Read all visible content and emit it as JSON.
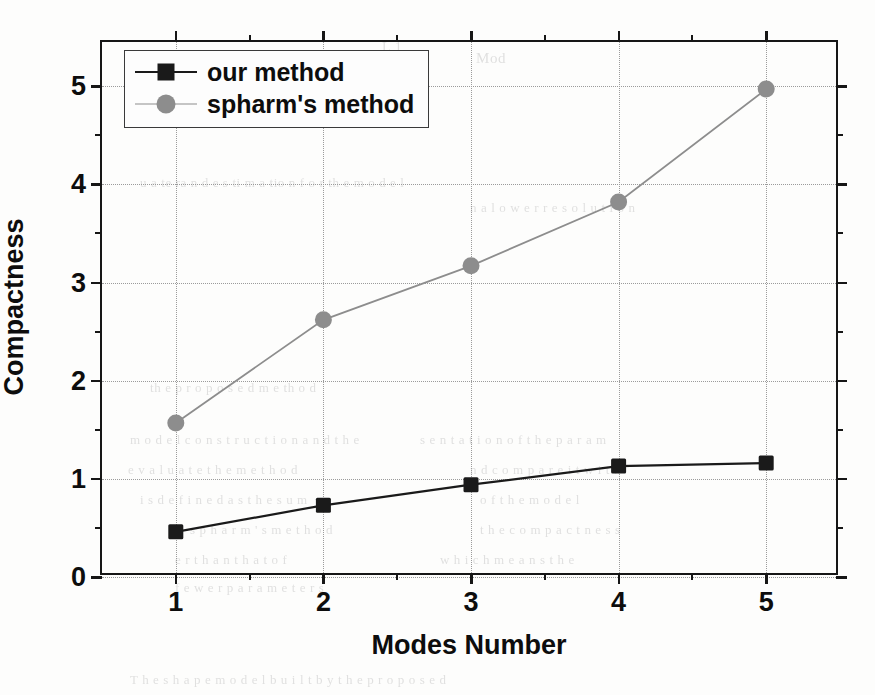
{
  "figure": {
    "background_note": "scanned page",
    "frame_color": "#161616"
  },
  "chart_data": {
    "type": "line",
    "title": "",
    "subtitle": "",
    "xlabel": "Modes Number",
    "ylabel": "Compactness",
    "x": [
      1,
      2,
      3,
      4,
      5
    ],
    "xtick_labels": [
      "1",
      "2",
      "3",
      "4",
      "5"
    ],
    "ytick_labels": [
      "0",
      "1",
      "2",
      "3",
      "4",
      "5"
    ],
    "xlim": [
      0.5,
      5.5
    ],
    "ylim": [
      0,
      5.45
    ],
    "grid": true,
    "grid_style": "dotted",
    "minor_ticks": true,
    "legend_position": "top-left",
    "series": [
      {
        "name": "our method",
        "values": [
          0.46,
          0.73,
          0.94,
          1.13,
          1.16
        ],
        "color": "#1a1a1a",
        "marker": "square",
        "marker_size": 15,
        "line_width": 2.2
      },
      {
        "name": "spharm's method",
        "values": [
          1.57,
          2.62,
          3.17,
          3.82,
          4.97
        ],
        "color": "#8d8d8d",
        "marker": "circle",
        "marker_size": 17,
        "line_width": 1.8
      }
    ]
  },
  "legend": {
    "items": [
      {
        "label": "our method",
        "color": "#1a1a1a",
        "marker": "square"
      },
      {
        "label": "spharm's method",
        "color": "#8d8d8d",
        "marker": "circle"
      }
    ]
  },
  "background_text": [
    {
      "text": "Mod",
      "x": 476,
      "y": 50,
      "size": 15
    },
    {
      "text": "2.",
      "x": 262,
      "y": 60,
      "size": 15
    },
    {
      "text": "L 1",
      "x": 382,
      "y": 40,
      "size": 14
    },
    {
      "text": "u a te ra n d e s ti m a tio n  f o r  th e  m o d e l",
      "x": 140,
      "y": 175,
      "size": 13
    },
    {
      "text": "n  a  l  o  w  e  r  r  e  s  o  l  u  t  i  o  n",
      "x": 470,
      "y": 200,
      "size": 13
    },
    {
      "text": "th e  p r o p o s e d  m e th o d",
      "x": 150,
      "y": 380,
      "size": 13
    },
    {
      "text": "m o d e l  c o n s t r u c t i o n   a n d   t h e",
      "x": 130,
      "y": 432,
      "size": 13
    },
    {
      "text": "s  e  n  t  a  t  i  o  n   o  f   t  h  e   p  a  r  a  m",
      "x": 420,
      "y": 432,
      "size": 13
    },
    {
      "text": "e  v  a  l  u  a  t  e     t  h  e     m  e  t  h  o  d",
      "x": 128,
      "y": 462,
      "size": 13
    },
    {
      "text": "n  d     c  o  m  p  a  r  e     i  t     w  i  t  h",
      "x": 470,
      "y": 462,
      "size": 13
    },
    {
      "text": "i  s   d  e  f  i  n  e  d   a  s   t  h  e   s  u  m",
      "x": 140,
      "y": 492,
      "size": 13
    },
    {
      "text": "o  f     t  h  e     m  o  d  e  l",
      "x": 480,
      "y": 492,
      "size": 13
    },
    {
      "text": "s  p  h  a  r  m  '  s     m  e  t  h  o  d",
      "x": 190,
      "y": 522,
      "size": 13
    },
    {
      "text": "t  h  e     c  o  m  p  a  c  t  n  e  s  s",
      "x": 480,
      "y": 522,
      "size": 13
    },
    {
      "text": "e  r     t  h  a  n     t  h  a  t     o  f",
      "x": 175,
      "y": 552,
      "size": 13
    },
    {
      "text": "w  h  i  c  h     m  e  a  n  s     t  h  e",
      "x": 440,
      "y": 552,
      "size": 13
    },
    {
      "text": "f  e  w  e  r     p  a  r  a  m  e  t  e  r  s",
      "x": 175,
      "y": 580,
      "size": 13
    },
    {
      "text": "T  h  e    s  h  a  p  e    m  o  d  e  l    b  u  i  l  t    b  y    t  h  e    p  r  o  p  o  s  e  d",
      "x": 130,
      "y": 672,
      "size": 13
    }
  ]
}
